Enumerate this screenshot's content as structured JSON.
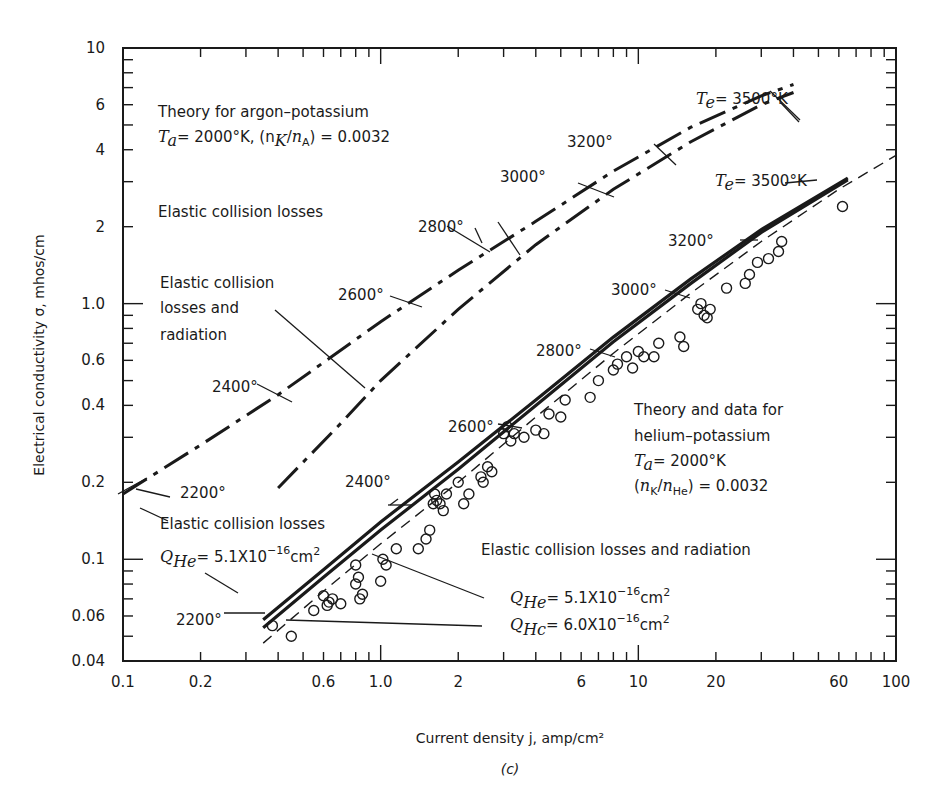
{
  "figure": {
    "caption": "(c)",
    "xlabel": "Current density j, amp/cm²",
    "ylabel": "Electrical conductivity σ, mhos/cm"
  },
  "chart_data": {
    "type": "line",
    "title": "",
    "xlabel": "Current density j, amp/cm²",
    "ylabel": "Electrical conductivity σ, mhos/cm",
    "xscale": "log",
    "yscale": "log",
    "xlim": [
      0.1,
      100
    ],
    "ylim": [
      0.04,
      10
    ],
    "grid": false,
    "x_ticks": [
      "0.1",
      "0.2",
      "0.6",
      "1.0",
      "2",
      "6",
      "10",
      "20",
      "60",
      "100"
    ],
    "y_ticks": [
      "10",
      "6",
      "4",
      "2",
      "1.0",
      "0.6",
      "0.4",
      "0.2",
      "0.1",
      "0.06",
      "0.04"
    ],
    "caption": "(c)",
    "series": [
      {
        "name": "Argon-potassium: Elastic collision losses",
        "style": "dash-dot",
        "x": [
          0.1,
          0.2,
          0.4,
          1.0,
          2.0,
          4.0,
          8.0,
          16.0,
          30.0,
          40.0
        ],
        "y": [
          0.18,
          0.28,
          0.44,
          0.85,
          1.35,
          2.1,
          3.3,
          4.9,
          6.5,
          7.2
        ]
      },
      {
        "name": "Argon-potassium: Elastic collision losses and radiation",
        "style": "dash-dot",
        "x": [
          0.4,
          0.7,
          1.0,
          2.0,
          4.0,
          8.0,
          16.0,
          30.0,
          40.0
        ],
        "y": [
          0.19,
          0.34,
          0.5,
          0.95,
          1.7,
          2.8,
          4.3,
          6.0,
          6.7
        ]
      },
      {
        "name": "Helium-potassium: Elastic collision losses, Q_He = 5.1X10^-16 cm²",
        "style": "solid",
        "x": [
          0.35,
          0.6,
          1.0,
          2.0,
          4.0,
          8.0,
          16.0,
          30.0,
          65.0
        ],
        "y": [
          0.058,
          0.091,
          0.14,
          0.24,
          0.42,
          0.74,
          1.25,
          1.95,
          3.1
        ]
      },
      {
        "name": "Helium-potassium: Elastic collision losses and radiation, Q_He = 5.1X10^-16 cm²",
        "style": "solid",
        "x": [
          0.35,
          0.6,
          1.0,
          2.0,
          4.0,
          8.0,
          16.0,
          30.0,
          65.0
        ],
        "y": [
          0.054,
          0.085,
          0.13,
          0.225,
          0.4,
          0.71,
          1.2,
          1.9,
          3.05
        ]
      },
      {
        "name": "Helium-potassium: Elastic collision losses and radiation, Q_He = 6.0X10^-16 cm²",
        "style": "dashed",
        "x": [
          0.35,
          0.6,
          1.0,
          2.0,
          4.0,
          8.0,
          16.0,
          30.0,
          60.0,
          100.0
        ],
        "y": [
          0.047,
          0.075,
          0.115,
          0.2,
          0.36,
          0.64,
          1.1,
          1.75,
          2.8,
          3.8
        ]
      },
      {
        "name": "Helium-potassium data",
        "style": "markers-open-circle",
        "x": [
          0.38,
          0.45,
          0.55,
          0.6,
          0.62,
          0.63,
          0.65,
          0.7,
          0.8,
          0.8,
          0.82,
          0.83,
          0.85,
          1.02,
          1.05,
          1.0,
          1.15,
          1.4,
          1.5,
          1.55,
          1.6,
          1.62,
          1.65,
          1.7,
          1.8,
          1.75,
          2.0,
          2.1,
          2.2,
          2.5,
          2.6,
          2.7,
          2.45,
          3.0,
          3.1,
          3.2,
          3.3,
          3.6,
          4.0,
          4.3,
          4.5,
          5.0,
          5.2,
          6.5,
          7.0,
          8.0,
          8.3,
          9.0,
          9.5,
          10.0,
          10.5,
          11.5,
          12.0,
          14.5,
          15.0,
          17.0,
          17.5,
          18.0,
          18.5,
          19.0,
          22.0,
          26.0,
          27.0,
          29.0,
          32.0,
          35.0,
          36.0,
          62.0
        ],
        "y": [
          0.055,
          0.05,
          0.063,
          0.072,
          0.066,
          0.068,
          0.07,
          0.067,
          0.095,
          0.08,
          0.085,
          0.07,
          0.073,
          0.1,
          0.095,
          0.082,
          0.11,
          0.11,
          0.12,
          0.13,
          0.165,
          0.18,
          0.17,
          0.165,
          0.18,
          0.155,
          0.2,
          0.165,
          0.18,
          0.2,
          0.23,
          0.22,
          0.21,
          0.31,
          0.33,
          0.29,
          0.31,
          0.3,
          0.32,
          0.31,
          0.37,
          0.36,
          0.42,
          0.43,
          0.5,
          0.55,
          0.58,
          0.62,
          0.56,
          0.65,
          0.62,
          0.62,
          0.7,
          0.74,
          0.68,
          0.95,
          1.0,
          0.9,
          0.88,
          0.95,
          1.15,
          1.2,
          1.3,
          1.45,
          1.5,
          1.6,
          1.75,
          2.4
        ]
      }
    ],
    "annotations": [
      {
        "text": "Theory for argon–potassium",
        "x": 0.14,
        "y": 6.6
      },
      {
        "text": "T_a = 2000°K, (n_K/n_A) = 0.0032",
        "x": 0.14,
        "y": 5.0
      },
      {
        "text": "T_e = 3500°K",
        "x": 27,
        "y": 7.6
      },
      {
        "text": "3200°",
        "x": 18,
        "y": 4.6
      },
      {
        "text": "3000°",
        "x": 9.8,
        "y": 3.2
      },
      {
        "text": "2800°",
        "x": 4.3,
        "y": 1.95
      },
      {
        "text": "2600°",
        "x": 2.9,
        "y": 0.95
      },
      {
        "text": "2400°",
        "x": 0.72,
        "y": 0.47
      },
      {
        "text": "2200°",
        "x": 0.25,
        "y": 0.17
      },
      {
        "text": "Elastic collision losses",
        "x": 0.14,
        "y": 2.0
      },
      {
        "text": "Elastic collision losses and radiation",
        "x": 0.14,
        "y": 1.2
      },
      {
        "text": "T_e = 3500°K",
        "x": 50,
        "y": 3.2
      },
      {
        "text": "3200°",
        "x": 33,
        "y": 1.9
      },
      {
        "text": "3000°",
        "x": 12,
        "y": 1.05
      },
      {
        "text": "2800°",
        "x": 6.3,
        "y": 0.65
      },
      {
        "text": "2600°",
        "x": 2.8,
        "y": 0.33
      },
      {
        "text": "2400°",
        "x": 1.2,
        "y": 0.2
      },
      {
        "text": "2200°",
        "x": 0.31,
        "y": 0.06
      },
      {
        "text": "Theory and data for helium–potassium",
        "x": 14,
        "y": 0.4
      },
      {
        "text": "T_a = 2000°K",
        "x": 14,
        "y": 0.26
      },
      {
        "text": "(n_K/n_He) = 0.0032",
        "x": 14,
        "y": 0.2
      },
      {
        "text": "Elastic collision losses",
        "x": 0.14,
        "y": 0.14
      },
      {
        "text": "Q_He = 5.1X10^-16 cm²",
        "x": 0.14,
        "y": 0.1
      },
      {
        "text": "Elastic collision losses and radiation",
        "x": 10,
        "y": 0.1
      },
      {
        "text": "Q_He = 5.1X10^-16 cm²",
        "x": 11,
        "y": 0.068
      },
      {
        "text": "Q_He = 6.0X10^-16 cm²",
        "x": 11,
        "y": 0.055
      }
    ]
  },
  "labels": {
    "argon_title": "Theory for argon–potassium",
    "argon_params_prefix": "= 2000°K, (n",
    "argon_params_ratio": ") = 0.0032",
    "argon_te": "= 3500°K",
    "argon_3200": "3200°",
    "argon_3000": "3000°",
    "argon_2800": "2800°",
    "argon_2600": "2600°",
    "argon_2400": "2400°",
    "argon_2200": "2200°",
    "argon_elastic": "Elastic collision losses",
    "argon_elastic_rad_1": "Elastic collision",
    "argon_elastic_rad_2": "losses and",
    "argon_elastic_rad_3": "radiation",
    "he_te": "= 3500°K",
    "he_3200": "3200°",
    "he_3000": "3000°",
    "he_2800": "2800°",
    "he_2600": "2600°",
    "he_2400": "2400°",
    "he_2200": "2200°",
    "he_title_1": "Theory and data for",
    "he_title_2": "helium–potassium",
    "he_ta": "= 2000°K",
    "he_ratio": ") = 0.0032",
    "he_elastic": "Elastic collision losses",
    "he_q51_left": "= 5.1X10",
    "he_elastic_rad": "Elastic collision losses and radiation",
    "he_q51_right": "=  5.1X10",
    "he_q60_right": "=  6.0X10",
    "exp": "−16",
    "cm": "cm",
    "sq": "2"
  }
}
